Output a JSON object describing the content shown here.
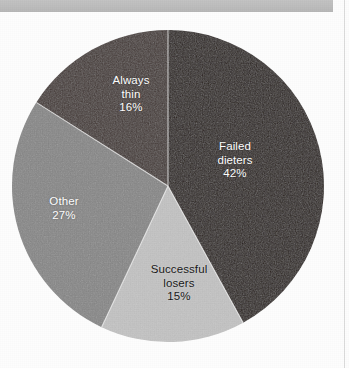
{
  "page": {
    "background_color": "#fdfdfd",
    "header_bar_color": "#bcbcbc",
    "rule_color": "#dcdcdc"
  },
  "chart_data": {
    "type": "pie",
    "title": "",
    "subtitle": "",
    "xlabel": "",
    "ylabel": "",
    "legend_position": "none",
    "grid": false,
    "labels_inside_slices": true,
    "start_angle_deg": 0,
    "direction": "clockwise",
    "units": "percent",
    "total": 100,
    "categories": [
      "Failed dieters",
      "Successful losers",
      "Other",
      "Always thin"
    ],
    "values": [
      42,
      15,
      27,
      16
    ],
    "value_labels": [
      "42%",
      "15%",
      "27%",
      "16%"
    ],
    "colors": [
      "#2a201c",
      "#c4c4c4",
      "#878787",
      "#443936"
    ],
    "slices": [
      {
        "name": "Failed dieters",
        "label_line1": "Failed",
        "label_line2": "dieters",
        "value": 42,
        "value_label": "42%",
        "color": "#2a201c",
        "text_color": "#ffffff",
        "start_deg": 0,
        "end_deg": 151.2
      },
      {
        "name": "Successful losers",
        "label_line1": "Successful",
        "label_line2": "losers",
        "value": 15,
        "value_label": "15%",
        "color": "#c4c4c4",
        "text_color": "#171717",
        "start_deg": 151.2,
        "end_deg": 205.2
      },
      {
        "name": "Other",
        "label_line1": "Other",
        "label_line2": "",
        "value": 27,
        "value_label": "27%",
        "color": "#878787",
        "text_color": "#ffffff",
        "start_deg": 205.2,
        "end_deg": 302.4
      },
      {
        "name": "Always thin",
        "label_line1": "Always",
        "label_line2": "thin",
        "value": 16,
        "value_label": "16%",
        "color": "#443936",
        "text_color": "#ffffff",
        "start_deg": 302.4,
        "end_deg": 360
      }
    ],
    "geometry": {
      "center_x": 168,
      "center_y": 186,
      "radius": 156
    }
  }
}
